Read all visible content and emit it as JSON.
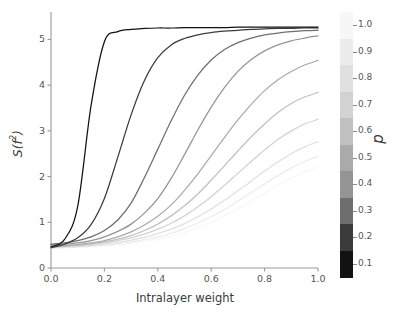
{
  "chart_data": {
    "type": "line",
    "title": "",
    "xlabel": "Intralayer weight",
    "ylabel": "S(f²)",
    "xlim": [
      0.0,
      1.0
    ],
    "ylim": [
      0.0,
      5.6
    ],
    "grid": false,
    "legend_position": "colorbar-right",
    "colorbar": {
      "label": "p",
      "ticks": [
        "1.0",
        "0.9",
        "0.8",
        "0.7",
        "0.6",
        "0.5",
        "0.4",
        "0.3",
        "0.2",
        "0.1"
      ],
      "tick_values": [
        1.0,
        0.9,
        0.8,
        0.7,
        0.6,
        0.5,
        0.4,
        0.3,
        0.2,
        0.1
      ],
      "colors": [
        "#f7f7f7",
        "#ececec",
        "#e0e0e0",
        "#d2d2d2",
        "#c0c0c0",
        "#aaaaaa",
        "#949494",
        "#6e6e6e",
        "#3b3b3b",
        "#121212"
      ],
      "orientation": "vertical",
      "discrete": true,
      "n_levels": 10
    },
    "xticks": [
      "0.0",
      "0.2",
      "0.4",
      "0.6",
      "0.8",
      "1.0"
    ],
    "xtick_values": [
      0.0,
      0.2,
      0.4,
      0.6,
      0.8,
      1.0
    ],
    "yticks": [
      "0",
      "1",
      "2",
      "3",
      "4",
      "5"
    ],
    "ytick_values": [
      0,
      1,
      2,
      3,
      4,
      5
    ],
    "x": [
      0.0,
      0.05,
      0.1,
      0.15,
      0.2,
      0.25,
      0.3,
      0.35,
      0.4,
      0.45,
      0.5,
      0.55,
      0.6,
      0.65,
      0.7,
      0.75,
      0.8,
      0.85,
      0.9,
      0.95,
      1.0
    ],
    "series": [
      {
        "name": "p = 0.1",
        "p": 0.1,
        "color": "#121212",
        "values": [
          0.46,
          0.62,
          1.35,
          3.55,
          4.95,
          5.17,
          5.22,
          5.24,
          5.25,
          5.25,
          5.26,
          5.26,
          5.26,
          5.26,
          5.27,
          5.27,
          5.27,
          5.27,
          5.27,
          5.27,
          5.27
        ]
      },
      {
        "name": "p = 0.2",
        "p": 0.2,
        "color": "#3b3b3b",
        "values": [
          0.44,
          0.52,
          0.66,
          0.95,
          1.52,
          2.42,
          3.35,
          4.1,
          4.6,
          4.88,
          5.02,
          5.1,
          5.15,
          5.18,
          5.2,
          5.22,
          5.23,
          5.24,
          5.24,
          5.25,
          5.25
        ]
      },
      {
        "name": "p = 0.3",
        "p": 0.3,
        "color": "#6e6e6e",
        "values": [
          0.52,
          0.55,
          0.6,
          0.68,
          0.82,
          1.05,
          1.42,
          1.98,
          2.6,
          3.22,
          3.78,
          4.22,
          4.55,
          4.78,
          4.93,
          5.03,
          5.1,
          5.14,
          5.17,
          5.19,
          5.2
        ]
      },
      {
        "name": "p = 0.4",
        "p": 0.4,
        "color": "#949494",
        "values": [
          0.5,
          0.52,
          0.55,
          0.6,
          0.68,
          0.8,
          0.96,
          1.2,
          1.52,
          1.96,
          2.48,
          3.02,
          3.52,
          3.95,
          4.3,
          4.56,
          4.75,
          4.88,
          4.97,
          5.03,
          5.08
        ]
      },
      {
        "name": "p = 0.5",
        "p": 0.5,
        "color": "#aaaaaa",
        "values": [
          0.48,
          0.49,
          0.51,
          0.55,
          0.6,
          0.68,
          0.79,
          0.94,
          1.13,
          1.38,
          1.7,
          2.06,
          2.46,
          2.86,
          3.24,
          3.58,
          3.88,
          4.12,
          4.3,
          4.44,
          4.54
        ]
      },
      {
        "name": "p = 0.6",
        "p": 0.6,
        "color": "#c0c0c0",
        "values": [
          0.47,
          0.48,
          0.5,
          0.53,
          0.57,
          0.63,
          0.71,
          0.82,
          0.96,
          1.14,
          1.36,
          1.62,
          1.92,
          2.24,
          2.56,
          2.87,
          3.15,
          3.4,
          3.6,
          3.74,
          3.84
        ]
      },
      {
        "name": "p = 0.7",
        "p": 0.7,
        "color": "#d2d2d2",
        "values": [
          0.46,
          0.47,
          0.49,
          0.51,
          0.55,
          0.6,
          0.66,
          0.74,
          0.85,
          0.98,
          1.14,
          1.34,
          1.56,
          1.81,
          2.07,
          2.33,
          2.58,
          2.81,
          3.0,
          3.15,
          3.25
        ]
      },
      {
        "name": "p = 0.8",
        "p": 0.8,
        "color": "#e0e0e0",
        "values": [
          0.45,
          0.46,
          0.47,
          0.49,
          0.52,
          0.56,
          0.61,
          0.67,
          0.75,
          0.85,
          0.97,
          1.12,
          1.29,
          1.48,
          1.69,
          1.9,
          2.12,
          2.32,
          2.5,
          2.65,
          2.76
        ]
      },
      {
        "name": "p = 0.9",
        "p": 0.9,
        "color": "#ececec",
        "values": [
          0.44,
          0.45,
          0.46,
          0.48,
          0.5,
          0.53,
          0.57,
          0.62,
          0.68,
          0.76,
          0.86,
          0.98,
          1.12,
          1.28,
          1.46,
          1.65,
          1.84,
          2.02,
          2.19,
          2.33,
          2.44
        ]
      },
      {
        "name": "p = 1.0",
        "p": 1.0,
        "color": "#f7f7f7",
        "values": [
          0.43,
          0.44,
          0.45,
          0.46,
          0.48,
          0.51,
          0.54,
          0.58,
          0.63,
          0.7,
          0.78,
          0.88,
          1.0,
          1.14,
          1.3,
          1.47,
          1.64,
          1.81,
          1.97,
          2.1,
          2.2
        ]
      }
    ]
  },
  "axes": {
    "xlabel": "Intralayer weight",
    "ylabel_main": "S(f",
    "ylabel_sup": "2",
    "ylabel_close": ")"
  }
}
